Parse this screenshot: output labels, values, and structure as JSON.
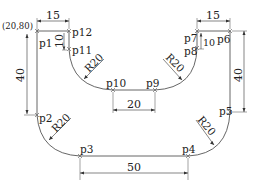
{
  "drawing": {
    "origin_label": "(20,80)",
    "points": [
      {
        "id": "p1",
        "label": "p1"
      },
      {
        "id": "p2",
        "label": "p2"
      },
      {
        "id": "p3",
        "label": "p3"
      },
      {
        "id": "p4",
        "label": "p4"
      },
      {
        "id": "p5",
        "label": "p5"
      },
      {
        "id": "p6",
        "label": "p6"
      },
      {
        "id": "p7",
        "label": "p7"
      },
      {
        "id": "p8",
        "label": "p8"
      },
      {
        "id": "p9",
        "label": "p9"
      },
      {
        "id": "p10",
        "label": "p10"
      },
      {
        "id": "p11",
        "label": "p11"
      },
      {
        "id": "p12",
        "label": "p12"
      }
    ],
    "dimensions": {
      "top_left_width": "15",
      "top_right_width": "15",
      "left_notch_height": "10",
      "right_notch_height": "10",
      "left_height": "40",
      "right_height": "40",
      "inner_bottom_width": "20",
      "bottom_width": "50"
    },
    "radii": {
      "inner_left": "R20",
      "inner_right": "R20",
      "outer_left": "R20",
      "outer_right": "R20"
    }
  }
}
